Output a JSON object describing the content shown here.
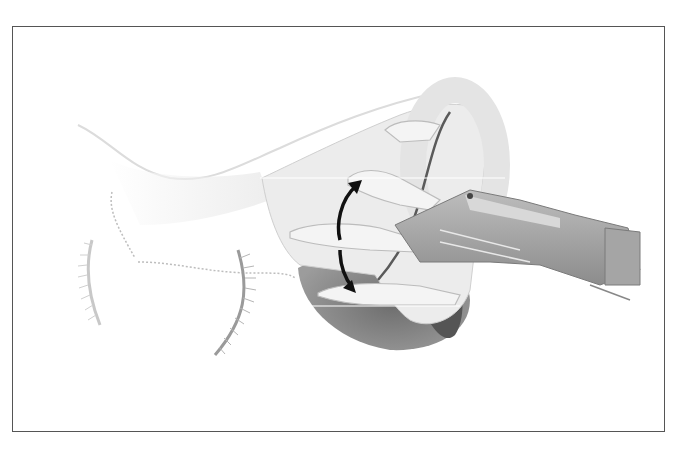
{
  "figure": {
    "kind": "grayscale anatomical illustration",
    "colors": {
      "background": "#ffffff",
      "frame_border": "#555555",
      "skin_light": "#f2f2f2",
      "tissue_mid": "#d6d6d6",
      "cavity_dark": "#8a8a8a",
      "instrument": "#9a9a9a",
      "arrow": "#111111",
      "ring_line": "#555555"
    },
    "arrow": {
      "type": "curved double-headed",
      "meaning": "rotation"
    }
  }
}
